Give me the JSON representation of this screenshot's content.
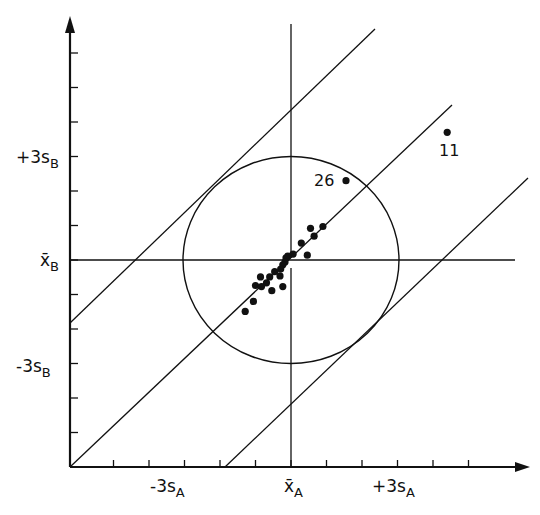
{
  "chart_data": {
    "type": "scatter",
    "title": "",
    "subtitle": "Youden plot: results of laboratories for sample A vs sample B",
    "xlabel": "",
    "ylabel": "",
    "axes": {
      "x": {
        "ticks": 11,
        "labels": [
          {
            "text": "-3s",
            "sub": "A",
            "at": -3
          },
          {
            "text": "x̄",
            "sub": "A",
            "at": 0
          },
          {
            "text": "+3s",
            "sub": "A",
            "at": 3
          }
        ]
      },
      "y": {
        "ticks": 12,
        "labels": [
          {
            "text": "+3s",
            "sub": "B",
            "at": 3
          },
          {
            "text": "x̄",
            "sub": "B",
            "at": 0
          },
          {
            "text": "-3s",
            "sub": "B",
            "at": -3
          }
        ]
      },
      "xlim": [
        -6,
        6.3
      ],
      "ylim": [
        -5.9,
        6
      ],
      "grid": false
    },
    "center": {
      "x": 0,
      "y": 0
    },
    "circle": {
      "radius_s": 3,
      "label": "3s circle"
    },
    "reference_lines": [
      {
        "name": "upper-limit-line",
        "slope": 1,
        "offset_s": 4.2
      },
      {
        "name": "diagonal-line",
        "slope": 1,
        "offset_s": 0
      },
      {
        "name": "lower-limit-line",
        "slope": 1,
        "offset_s": -4.2
      }
    ],
    "points": [
      {
        "x": 1.55,
        "y": 2.3,
        "label": "26"
      },
      {
        "x": 4.4,
        "y": 3.7,
        "label": "11"
      },
      {
        "x": 0.55,
        "y": 0.92
      },
      {
        "x": 0.9,
        "y": 0.97
      },
      {
        "x": 0.65,
        "y": 0.69
      },
      {
        "x": 0.29,
        "y": 0.49
      },
      {
        "x": 0.46,
        "y": 0.14
      },
      {
        "x": 0.06,
        "y": 0.17
      },
      {
        "x": -0.09,
        "y": 0.11
      },
      {
        "x": -0.14,
        "y": 0.06
      },
      {
        "x": -0.17,
        "y": -0.06
      },
      {
        "x": -0.23,
        "y": -0.14
      },
      {
        "x": -0.29,
        "y": -0.26
      },
      {
        "x": -0.46,
        "y": -0.34
      },
      {
        "x": -0.31,
        "y": -0.46
      },
      {
        "x": -0.6,
        "y": -0.49
      },
      {
        "x": -0.86,
        "y": -0.49
      },
      {
        "x": -1.0,
        "y": -0.74
      },
      {
        "x": -0.83,
        "y": -0.77
      },
      {
        "x": -0.69,
        "y": -0.66
      },
      {
        "x": -0.54,
        "y": -0.89
      },
      {
        "x": -0.23,
        "y": -0.77
      },
      {
        "x": -1.06,
        "y": -1.2
      },
      {
        "x": -1.29,
        "y": -1.49
      }
    ],
    "legend": null
  },
  "labels": {
    "x_minus3": {
      "main": "-3s",
      "sub": "A"
    },
    "x_mean": {
      "main": "x̄",
      "sub": "A"
    },
    "x_plus3": {
      "main": "+3s",
      "sub": "A"
    },
    "y_plus3": {
      "main": "+3s",
      "sub": "B"
    },
    "y_mean": {
      "main": "x̄",
      "sub": "B"
    },
    "y_minus3": {
      "main": "-3s",
      "sub": "B"
    },
    "pt26": "26",
    "pt11": "11"
  },
  "style": {
    "ink": "#111111",
    "background": "#ffffff"
  }
}
